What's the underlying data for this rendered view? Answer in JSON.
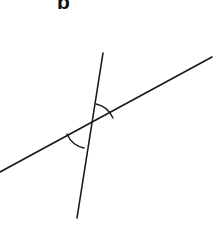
{
  "figure": {
    "label": "b",
    "background_color": "#ffffff",
    "stroke_color": "#1a1a1a",
    "width": 217,
    "height": 241
  },
  "geometry": {
    "intersection": {
      "x": 90,
      "y": 126
    },
    "lines": [
      {
        "name": "transversal-line",
        "description": "long shallow line rising left to right",
        "x1": 0,
        "y1": 172,
        "x2": 212,
        "y2": 57,
        "stroke_width": 1.6
      },
      {
        "name": "steep-line",
        "description": "steep line descending slightly leftward",
        "x1": 103,
        "y1": 53,
        "x2": 77,
        "y2": 218,
        "stroke_width": 1.6
      }
    ],
    "angle_arcs": [
      {
        "name": "upper-right-angle-arc",
        "description": "arc in the wedge above the transversal and right of the steep line",
        "path": "M 96 104 A 24 24 0 0 1 113 118",
        "stroke_width": 1.4
      },
      {
        "name": "lower-left-angle-arc",
        "description": "vertical angle arc opposite the upper arc",
        "path": "M 84 148 A 24 24 0 0 1 67 134",
        "stroke_width": 1.4
      }
    ]
  }
}
